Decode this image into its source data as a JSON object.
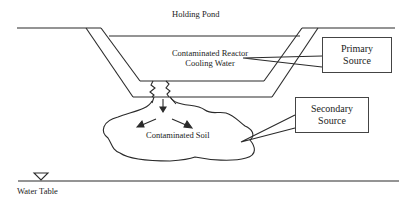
{
  "diagram": {
    "title": "Holding Pond",
    "water_label_line1": "Contaminated Reactor",
    "water_label_line2": "Cooling Water",
    "soil_label": "Contaminated Soil",
    "primary_box": {
      "line1": "Primary",
      "line2": "Source"
    },
    "secondary_box": {
      "line1": "Secondary",
      "line2": "Source"
    },
    "water_table_label": "Water Table",
    "line_color": "#2a2a2a"
  }
}
